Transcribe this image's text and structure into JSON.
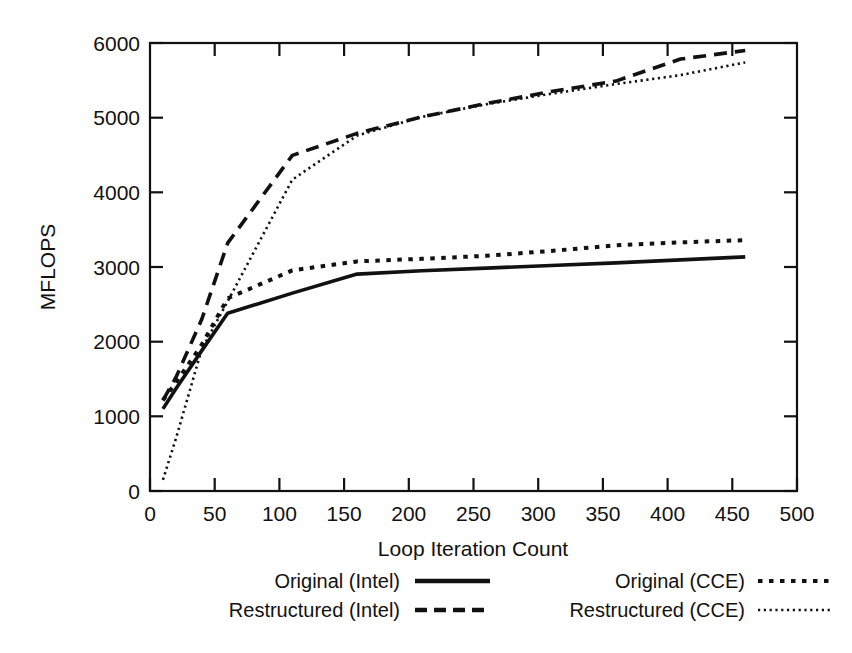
{
  "chart_data": {
    "type": "line",
    "title": "",
    "xlabel": "Loop Iteration Count",
    "ylabel": "MFLOPS",
    "xlim": [
      0,
      500
    ],
    "ylim": [
      0,
      6000
    ],
    "xticks": [
      0,
      50,
      100,
      150,
      200,
      250,
      300,
      350,
      400,
      450,
      500
    ],
    "yticks": [
      0,
      1000,
      2000,
      3000,
      4000,
      5000,
      6000
    ],
    "grid": false,
    "legend_position": "bottom",
    "series": [
      {
        "name": "Original (Intel)",
        "style": "solid",
        "color": "#111111",
        "x": [
          10,
          20,
          40,
          60,
          110,
          160,
          210,
          260,
          310,
          360,
          410,
          460
        ],
        "y": [
          1100,
          1370,
          1880,
          2380,
          2650,
          2905,
          2950,
          2985,
          3020,
          3055,
          3095,
          3135
        ]
      },
      {
        "name": "Restructured (Intel)",
        "style": "dashed",
        "color": "#111111",
        "x": [
          10,
          20,
          40,
          60,
          110,
          160,
          210,
          260,
          310,
          360,
          410,
          460
        ],
        "y": [
          1215,
          1520,
          2300,
          3320,
          4495,
          4790,
          5010,
          5190,
          5350,
          5490,
          5785,
          5900
        ]
      },
      {
        "name": "Original (CCE)",
        "style": "dotted",
        "color": "#111111",
        "x": [
          10,
          20,
          40,
          60,
          110,
          160,
          210,
          260,
          310,
          360,
          410,
          460
        ],
        "y": [
          1215,
          1450,
          1960,
          2580,
          2955,
          3075,
          3110,
          3150,
          3215,
          3290,
          3330,
          3360
        ]
      },
      {
        "name": "Restructured (CCE)",
        "style": "fine-dotted",
        "color": "#111111",
        "x": [
          10,
          20,
          40,
          60,
          110,
          160,
          210,
          260,
          310,
          360,
          410,
          460
        ],
        "y": [
          150,
          700,
          1900,
          2540,
          4170,
          4760,
          5010,
          5180,
          5320,
          5450,
          5570,
          5740
        ]
      }
    ]
  },
  "axes": {
    "y_title": "MFLOPS",
    "x_title": "Loop Iteration Count",
    "y_tick_labels": [
      "0",
      "1000",
      "2000",
      "3000",
      "4000",
      "5000",
      "6000"
    ],
    "x_tick_labels": [
      "0",
      "50",
      "100",
      "150",
      "200",
      "250",
      "300",
      "350",
      "400",
      "450",
      "500"
    ]
  },
  "legend": {
    "entries": [
      {
        "label": "Original (Intel)",
        "style": "solid"
      },
      {
        "label": "Restructured (Intel)",
        "style": "dashed"
      },
      {
        "label": "Original (CCE)",
        "style": "dotted"
      },
      {
        "label": "Restructured (CCE)",
        "style": "fine-dotted"
      }
    ]
  }
}
